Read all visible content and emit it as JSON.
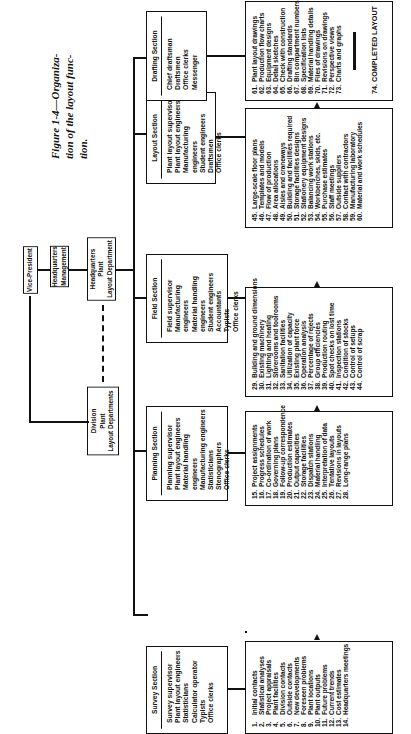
{
  "figure": {
    "caption_lines": [
      "Figure 1-4—Organiza-",
      "tion of the layout func-",
      "tion."
    ]
  },
  "org": {
    "vice_president": [
      "Vice-President"
    ],
    "hq_management": [
      "Headquarters",
      "Management"
    ],
    "hq_plant_layout": [
      "Headquarters",
      "Plant",
      "Layout Department"
    ],
    "division_plant_layout": [
      "Division",
      "Plant",
      "Layout Departments"
    ]
  },
  "sections": [
    {
      "title": "Survey Section",
      "staff": [
        "Survey supervisor",
        "Plant layout engineers",
        "Statisticians",
        "Calculator operator",
        "Typists",
        "Office clerks"
      ],
      "tasks": [
        {
          "n": "1.",
          "t": "Initial contacts"
        },
        {
          "n": "2.",
          "t": "Statistical analyses"
        },
        {
          "n": "3.",
          "t": "Project appraisals"
        },
        {
          "n": "4.",
          "t": "Plant facilities"
        },
        {
          "n": "5.",
          "t": "Division contacts"
        },
        {
          "n": "6.",
          "t": "Outside contacts"
        },
        {
          "n": "7.",
          "t": "New developments"
        },
        {
          "n": "8.",
          "t": "Foreseen problems"
        },
        {
          "n": "9.",
          "t": "Plant locations"
        },
        {
          "n": "10.",
          "t": "Plant outputs"
        },
        {
          "n": "11.",
          "t": "Future problems"
        },
        {
          "n": "12.",
          "t": "Current trends"
        },
        {
          "n": "13.",
          "t": "Cost estimates"
        },
        {
          "n": "14.",
          "t": "Headquarters meetings"
        }
      ]
    },
    {
      "title": "Planning Section",
      "staff": [
        "Planning supervisor",
        "Plant layout engineers",
        "Material handling engineers",
        "Manufacturing engineers",
        "Statisticians",
        "Stenographers",
        "Office clerks"
      ],
      "tasks": [
        {
          "n": "15.",
          "t": "Project assignments"
        },
        {
          "n": "16.",
          "t": "Progress schedules"
        },
        {
          "n": "17.",
          "t": "Co-ordination of work"
        },
        {
          "n": "18.",
          "t": "Governing plans"
        },
        {
          "n": "19.",
          "t": "Follow-up correspondence"
        },
        {
          "n": "20.",
          "t": "Production estimates"
        },
        {
          "n": "21.",
          "t": "Output capacities"
        },
        {
          "n": "22.",
          "t": "Storage facilities"
        },
        {
          "n": "23.",
          "t": "Dispatch stations"
        },
        {
          "n": "24.",
          "t": "Material handling"
        },
        {
          "n": "25.",
          "t": "Interpretation of data"
        },
        {
          "n": "26.",
          "t": "Tentative layouts"
        },
        {
          "n": "27.",
          "t": "Revisions in layouts"
        },
        {
          "n": "28.",
          "t": "Long-range plans"
        }
      ]
    },
    {
      "title": "Field Section",
      "staff": [
        "Field supervisor",
        "Manufacturing engineers",
        "Material handling engineers",
        "Student engineers",
        "Accountants",
        "Typists",
        "Office clerks"
      ],
      "tasks": [
        {
          "n": "29.",
          "t": "Building and ground dimensions"
        },
        {
          "n": "30.",
          "t": "Existing machinery"
        },
        {
          "n": "31.",
          "t": "Lighting and heating"
        },
        {
          "n": "32.",
          "t": "Storerooms and toolrooms"
        },
        {
          "n": "33.",
          "t": "Sanitation facilities"
        },
        {
          "n": "34.",
          "t": "Utilization of capacity"
        },
        {
          "n": "35.",
          "t": "Existing plant force"
        },
        {
          "n": "36.",
          "t": "Operation analysis"
        },
        {
          "n": "37.",
          "t": "Percentage of rejects"
        },
        {
          "n": "38.",
          "t": "Group efficiencies"
        },
        {
          "n": "39.",
          "t": "Production routing"
        },
        {
          "n": "40.",
          "t": "Spot checks on lost time"
        },
        {
          "n": "41.",
          "t": "Inspection stations"
        },
        {
          "n": "42.",
          "t": "Condition of stocks"
        },
        {
          "n": "43.",
          "t": "Control of setups"
        },
        {
          "n": "44.",
          "t": "Control of scrap"
        }
      ]
    },
    {
      "title": "Layout Section",
      "staff": [
        "Plant layout supervisor",
        "Plant layout engineers",
        "Manufacturing engineers",
        "Student engineers",
        "Draftsmen",
        "Office clerks"
      ],
      "tasks": [
        {
          "n": "45.",
          "t": "Large-scale floor plans"
        },
        {
          "n": "46.",
          "t": "Templates and models"
        },
        {
          "n": "47.",
          "t": "Flow of production"
        },
        {
          "n": "48.",
          "t": "Area allocations"
        },
        {
          "n": "49.",
          "t": "Aisles and craneways"
        },
        {
          "n": "50.",
          "t": "Building and facilities required"
        },
        {
          "n": "51.",
          "t": "Storage facilities designs"
        },
        {
          "n": "52.",
          "t": "Stationery equipment designs"
        },
        {
          "n": "53.",
          "t": "Balancing work stations"
        },
        {
          "n": "54.",
          "t": "Workbenches, skids, etc."
        },
        {
          "n": "55.",
          "t": "Purchase estimates"
        },
        {
          "n": "56.",
          "t": "Staff meetings"
        },
        {
          "n": "57.",
          "t": "Outside suppliers"
        },
        {
          "n": "58.",
          "t": "Contact with contractors"
        },
        {
          "n": "59.",
          "t": "Manufacturing laboratory"
        },
        {
          "n": "60.",
          "t": "Material and work schedules"
        }
      ]
    },
    {
      "title": "Drafting Section",
      "staff": [
        "Chief draftsman",
        "Draftsmen",
        "Office clerks",
        "Messenger"
      ],
      "tasks": [
        {
          "n": "61.",
          "t": "Plant layout drawings"
        },
        {
          "n": "62.",
          "t": "Production flow charts"
        },
        {
          "n": "63.",
          "t": "Equipment designs"
        },
        {
          "n": "64.",
          "t": "Detail sketches"
        },
        {
          "n": "65.",
          "t": "Check with construction"
        },
        {
          "n": "66.",
          "t": "Drafting standards"
        },
        {
          "n": "67.",
          "t": "Bin compartment numbers"
        },
        {
          "n": "68.",
          "t": "Specification lists"
        },
        {
          "n": "69.",
          "t": "Material handling details"
        },
        {
          "n": "70.",
          "t": "Files of drawings"
        },
        {
          "n": "71.",
          "t": "Revisions on drawings"
        },
        {
          "n": "72.",
          "t": "Perspective views"
        },
        {
          "n": "73.",
          "t": "Charts and graphs"
        }
      ],
      "final": "74.  COMPLETED LAYOUT"
    }
  ]
}
